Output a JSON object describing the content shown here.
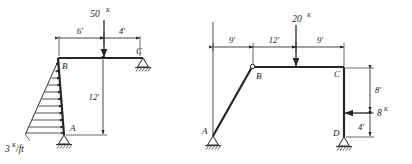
{
  "diagram": {
    "line_color": "#262626",
    "frames": [
      {
        "id": "left-frame",
        "joints": [
          {
            "name": "A",
            "label": "A"
          },
          {
            "name": "B",
            "label": "B"
          },
          {
            "name": "C",
            "label": "C"
          }
        ],
        "supports": [
          {
            "at": "A",
            "type": "pin"
          },
          {
            "at": "C",
            "type": "pin"
          }
        ],
        "point_loads": [
          {
            "value": "50",
            "unit": "K",
            "direction": "down",
            "on_member": "BC"
          }
        ],
        "distributed_loads": [
          {
            "value": "3",
            "unit": "K/ft",
            "shape": "triangular",
            "on_member": "AB",
            "direction": "right"
          }
        ],
        "dimensions": [
          {
            "label": "6'",
            "orientation": "horizontal"
          },
          {
            "label": "4'",
            "orientation": "horizontal"
          },
          {
            "label": "12'",
            "orientation": "vertical"
          }
        ]
      },
      {
        "id": "right-frame",
        "joints": [
          {
            "name": "A",
            "label": "A"
          },
          {
            "name": "B",
            "label": "B"
          },
          {
            "name": "C",
            "label": "C"
          },
          {
            "name": "D",
            "label": "D"
          }
        ],
        "supports": [
          {
            "at": "A",
            "type": "pin"
          },
          {
            "at": "D",
            "type": "pin"
          }
        ],
        "point_loads": [
          {
            "value": "20",
            "unit": "K",
            "direction": "down",
            "on_member": "BC"
          },
          {
            "value": "8",
            "unit": "K",
            "direction": "left",
            "on_member": "CD"
          }
        ],
        "dimensions": [
          {
            "label": "9'",
            "orientation": "horizontal"
          },
          {
            "label": "12'",
            "orientation": "horizontal"
          },
          {
            "label": "9'",
            "orientation": "horizontal"
          },
          {
            "label": "8'",
            "orientation": "vertical"
          },
          {
            "label": "4'",
            "orientation": "vertical"
          }
        ]
      }
    ],
    "labels": {
      "l_load_50": "50",
      "l_load_50_sup": "K",
      "l_dist_3": "3",
      "l_dist_3_sup": "K",
      "l_dist_3_den": "/ft",
      "l_dim_6": "6'",
      "l_dim_4": "4'",
      "l_dim_12": "12'",
      "l_joint_A": "A",
      "l_joint_B": "B",
      "l_joint_C": "C",
      "r_load_20": "20",
      "r_load_20_sup": "K",
      "r_load_8": "8",
      "r_load_8_sup": "K",
      "r_dim_9a": "9'",
      "r_dim_12": "12'",
      "r_dim_9b": "9'",
      "r_dim_8ft": "8'",
      "r_dim_4ft": "4'",
      "r_joint_A": "A",
      "r_joint_B": "B",
      "r_joint_C": "C",
      "r_joint_D": "D"
    }
  }
}
